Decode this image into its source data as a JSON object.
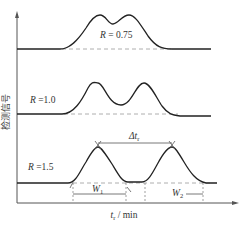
{
  "figure": {
    "y_axis_label": "检测信号",
    "x_axis_label_var": "t",
    "x_axis_label_sub": "r",
    "x_axis_label_unit": " / min",
    "curves": [
      {
        "R_var": "R",
        "R_text": " = 0.75",
        "resolution": 0.75
      },
      {
        "R_var": "R",
        "R_text": " =1.0",
        "resolution": 1.0
      },
      {
        "R_var": "R",
        "R_text": " =1.5",
        "resolution": 1.5
      }
    ],
    "annotations": {
      "delta_tr_sym": "Δt",
      "delta_tr_sub": "r",
      "w1_var": "W",
      "w1_sub": "1",
      "w2_var": "W",
      "w2_sub": "2"
    }
  }
}
